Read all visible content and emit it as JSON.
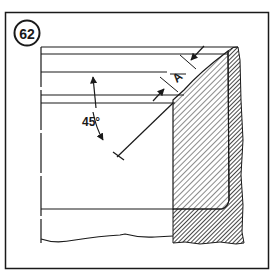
{
  "figure": {
    "number": "62",
    "angle_label": "45°",
    "dimension_label": "A"
  },
  "colors": {
    "ink": "#1a1a1a",
    "paper": "#ffffff"
  }
}
